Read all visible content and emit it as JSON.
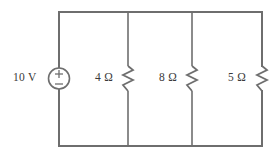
{
  "figure": {
    "type": "circuit-schematic",
    "stroke_color": "#6e6e6e",
    "text_color": "#3a3a3a",
    "background_color": "#ffffff"
  },
  "source": {
    "name": "voltage-source",
    "label": "10 V",
    "value": "10",
    "unit": "V",
    "polarity_top": "+",
    "polarity_bottom": "−",
    "symbol": "circle-plus-minus"
  },
  "resistors": [
    {
      "name": "resistor-r1",
      "label": "4 Ω",
      "value": "4",
      "unit": "Ω",
      "symbol": "zigzag"
    },
    {
      "name": "resistor-r2",
      "label": "8 Ω",
      "value": "8",
      "unit": "Ω",
      "symbol": "zigzag"
    },
    {
      "name": "resistor-r3",
      "label": "5 Ω",
      "value": "5",
      "unit": "Ω",
      "symbol": "zigzag"
    }
  ]
}
